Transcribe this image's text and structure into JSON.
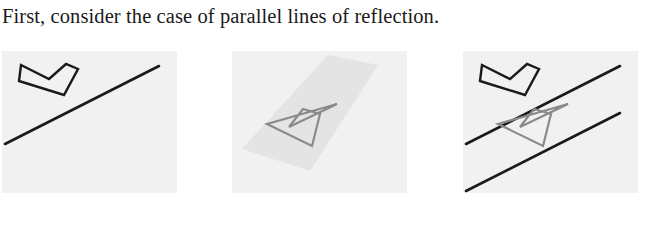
{
  "caption": {
    "text": "First, consider the case of parallel lines of reflection."
  },
  "colors": {
    "page_background": "#ffffff",
    "panel_background": "#f1f1f1",
    "original_shape_stroke": "#1a1a1a",
    "reflected_shape_stroke": "#8a8a8a",
    "mirror_line_stroke": "#1a1a1a",
    "sweep_region_fill": "#e4e4e4",
    "text_color": "#1a1a1a"
  },
  "figure": {
    "name": "parallel-lines-of-reflection-sequence",
    "panel_count": 3,
    "panels": [
      {
        "id": "panel-1",
        "label": "original-dart-and-first-mirror-line",
        "mirror_lines": [
          {
            "name": "mirror-line-1",
            "x1": 3,
            "y1": 93,
            "x2": 157,
            "y2": 15,
            "stroke": "#1a1a1a",
            "width": 2.6
          }
        ],
        "shapes": [
          {
            "name": "original-dart",
            "stroke": "#1a1a1a",
            "width": 2.4,
            "fill": "none",
            "points": "17,30 62,44 76,18 64,13 47,28 19,14"
          }
        ],
        "regions": []
      },
      {
        "id": "panel-2",
        "label": "sweep-region-and-reflected-dart",
        "mirror_lines": [],
        "regions": [
          {
            "name": "sweep-wedge",
            "fill": "#e4e4e4",
            "points": "10,98 96,4 146,14 78,120"
          }
        ],
        "shapes": [
          {
            "name": "reflected-dart",
            "stroke": "#8a8a8a",
            "width": 2.2,
            "fill": "none",
            "points": "35,73 80,95 88,63 71,58 57,76 105,53"
          }
        ]
      },
      {
        "id": "panel-3",
        "label": "both-parallel-mirror-lines-with-original-and-image",
        "mirror_lines": [
          {
            "name": "mirror-line-1",
            "x1": 3,
            "y1": 93,
            "x2": 157,
            "y2": 15,
            "stroke": "#1a1a1a",
            "width": 2.6
          },
          {
            "name": "mirror-line-2",
            "x1": 3,
            "y1": 140,
            "x2": 157,
            "y2": 62,
            "stroke": "#1a1a1a",
            "width": 2.6
          }
        ],
        "shapes": [
          {
            "name": "original-dart",
            "stroke": "#1a1a1a",
            "width": 2.4,
            "fill": "none",
            "points": "17,30 62,44 76,18 64,13 47,28 19,14"
          },
          {
            "name": "reflected-dart",
            "stroke": "#8a8a8a",
            "width": 2.2,
            "fill": "none",
            "points": "35,73 80,95 88,63 71,58 57,76 105,53"
          }
        ],
        "regions": []
      }
    ]
  }
}
